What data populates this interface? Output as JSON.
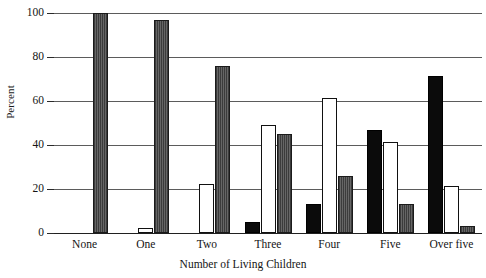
{
  "chart_data": {
    "type": "bar",
    "title": "",
    "subtitle": "",
    "xlabel": "Number of Living Children",
    "ylabel": "Percent",
    "categories": [
      "None",
      "One",
      "Two",
      "Three",
      "Four",
      "Five",
      "Over five"
    ],
    "series": [
      {
        "name": "black",
        "style": "solid-black",
        "color": "#0b0b0b",
        "values": [
          0,
          0,
          0,
          5,
          13,
          47,
          71.5
        ]
      },
      {
        "name": "white",
        "style": "hollow-white",
        "color": "#ffffff",
        "values": [
          0,
          2.5,
          22.5,
          49,
          61.5,
          41.5,
          21.5
        ]
      },
      {
        "name": "gray",
        "style": "hatched-gray",
        "color": "#555555",
        "values": [
          100,
          97,
          76,
          45,
          26,
          13,
          3
        ]
      }
    ],
    "ylim": [
      0,
      100
    ],
    "yticks": [
      0,
      20,
      40,
      60,
      80,
      100
    ],
    "ytick_labels": [
      "0",
      "20",
      "40",
      "60",
      "80",
      "100"
    ],
    "grid": true,
    "grid_axis": "y",
    "legend": false,
    "legend_position": "none",
    "frame": false
  }
}
